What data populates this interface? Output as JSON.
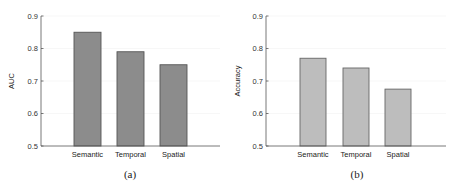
{
  "chart_data": [
    {
      "type": "bar",
      "panel": "(a)",
      "title": "",
      "xlabel": "",
      "ylabel": "AUC",
      "categories": [
        "Semantic",
        "Temporal",
        "Spatial"
      ],
      "values": [
        0.85,
        0.79,
        0.75
      ],
      "ylim": [
        0.5,
        0.9
      ],
      "yticks": [
        "0.5",
        "0.6",
        "0.7",
        "0.8",
        "0.9"
      ],
      "grid": true,
      "bar_color": "#8c8c8c",
      "edge_color": "#555555",
      "caption": "(a)"
    },
    {
      "type": "bar",
      "panel": "(b)",
      "title": "",
      "xlabel": "",
      "ylabel": "Accuracy",
      "categories": [
        "Semantic",
        "Temporal",
        "Spatial"
      ],
      "values": [
        0.77,
        0.74,
        0.675
      ],
      "ylim": [
        0.5,
        0.9
      ],
      "yticks": [
        "0.5",
        "0.6",
        "0.7",
        "0.8",
        "0.9"
      ],
      "grid": true,
      "bar_color": "#bdbdbd",
      "edge_color": "#666666",
      "caption": "(b)"
    }
  ],
  "figure": {
    "captions": [
      "(a)",
      "(b)"
    ]
  }
}
